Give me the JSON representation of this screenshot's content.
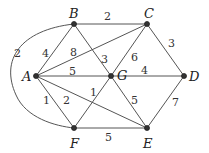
{
  "graph": {
    "nodes": [
      {
        "id": "A",
        "x": 36,
        "y": 76,
        "lx": 17,
        "ly": 81
      },
      {
        "id": "B",
        "x": 74,
        "y": 24,
        "lx": 69,
        "ly": 16
      },
      {
        "id": "C",
        "x": 147,
        "y": 24,
        "lx": 144,
        "ly": 16
      },
      {
        "id": "D",
        "x": 184,
        "y": 76,
        "lx": 190,
        "ly": 81
      },
      {
        "id": "E",
        "x": 147,
        "y": 128,
        "lx": 143,
        "ly": 148
      },
      {
        "id": "F",
        "x": 74,
        "y": 128,
        "lx": 70,
        "ly": 148
      },
      {
        "id": "G",
        "x": 111,
        "y": 76,
        "lx": 118,
        "ly": 80
      }
    ],
    "edges": [
      {
        "from": "B",
        "to": "C",
        "weight": "2",
        "lx": 107,
        "ly": 20
      },
      {
        "from": "C",
        "to": "D",
        "weight": "3",
        "lx": 170,
        "ly": 46
      },
      {
        "from": "A",
        "to": "B",
        "weight": "4",
        "lx": 44,
        "ly": 57
      },
      {
        "from": "A",
        "to": "C",
        "weight": "8",
        "lx": 72,
        "ly": 55
      },
      {
        "from": "B",
        "to": "G",
        "weight": "3",
        "lx": 101,
        "ly": 63
      },
      {
        "from": "C",
        "to": "G",
        "weight": "6",
        "lx": 133,
        "ly": 60
      },
      {
        "from": "A",
        "to": "G",
        "weight": "5",
        "lx": 70,
        "ly": 74
      },
      {
        "from": "G",
        "to": "D",
        "weight": "4",
        "lx": 143,
        "ly": 73
      },
      {
        "from": "A",
        "to": "F",
        "weight": "1",
        "lx": 44,
        "ly": 104
      },
      {
        "from": "A",
        "to": "E",
        "weight": "2",
        "lx": 65,
        "ly": 104
      },
      {
        "from": "F",
        "to": "G",
        "weight": "1",
        "lx": 91,
        "ly": 96
      },
      {
        "from": "G",
        "to": "E",
        "weight": "5",
        "lx": 133,
        "ly": 103
      },
      {
        "from": "D",
        "to": "E",
        "weight": "7",
        "lx": 174,
        "ly": 106
      },
      {
        "from": "F",
        "to": "E",
        "weight": "5",
        "lx": 107,
        "ly": 139
      },
      {
        "from": "B",
        "to": "F",
        "weight": "2",
        "curved": true,
        "lx": 13,
        "ly": 57
      }
    ]
  }
}
